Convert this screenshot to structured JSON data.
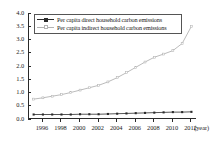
{
  "chart_data": {
    "type": "line",
    "title": "",
    "xlabel": "(year)",
    "ylabel": "",
    "xlim": [
      1994.5,
      2012.6
    ],
    "ylim": [
      0.0,
      4.0
    ],
    "grid": false,
    "legend_position": "top-left-inside",
    "x": [
      1995,
      1996,
      1997,
      1998,
      1999,
      2000,
      2001,
      2002,
      2003,
      2004,
      2005,
      2006,
      2007,
      2008,
      2009,
      2010,
      2011,
      2012
    ],
    "x_tick_labels": [
      "1996",
      "1998",
      "2000",
      "2002",
      "2004",
      "2006",
      "2008",
      "2010",
      "2012"
    ],
    "x_tick_values": [
      1996,
      1998,
      2000,
      2002,
      2004,
      2006,
      2008,
      2010,
      2012
    ],
    "y_tick_labels": [
      "0.0",
      "0.5",
      "1.0",
      "1.5",
      "2.0",
      "2.5",
      "3.0",
      "3.5",
      "4.0"
    ],
    "y_tick_values": [
      0.0,
      0.5,
      1.0,
      1.5,
      2.0,
      2.5,
      3.0,
      3.5,
      4.0
    ],
    "series": [
      {
        "name": "Per capita direct household carbon emissions",
        "color": "#2b2b2b",
        "marker": "square-filled",
        "values": [
          0.17,
          0.17,
          0.17,
          0.17,
          0.17,
          0.18,
          0.18,
          0.18,
          0.19,
          0.2,
          0.21,
          0.22,
          0.23,
          0.24,
          0.25,
          0.26,
          0.26,
          0.27
        ]
      },
      {
        "name": "Per capita indirect household carbon emissions",
        "color": "#b3b3b3",
        "marker": "square-open",
        "values": [
          0.75,
          0.8,
          0.86,
          0.92,
          1.0,
          1.09,
          1.18,
          1.27,
          1.4,
          1.56,
          1.75,
          1.95,
          2.15,
          2.33,
          2.45,
          2.58,
          2.85,
          3.5
        ]
      }
    ]
  },
  "legend": {
    "entries": [
      {
        "label": "Per capita direct household carbon emissions"
      },
      {
        "label": "Per capita indirect household carbon emissions"
      }
    ]
  },
  "axis": {
    "x_title": "(year)"
  }
}
